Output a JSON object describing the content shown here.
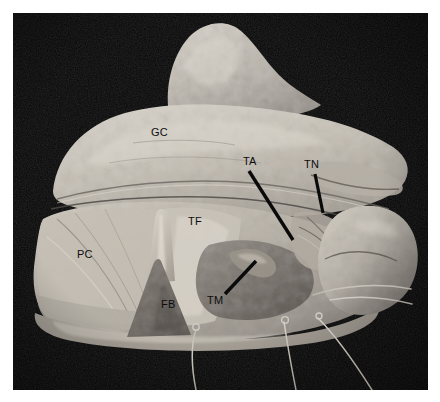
{
  "figure": {
    "kind": "anatomical-dissection-photograph",
    "background_color": "#ffffff",
    "plate_background_color": "#070707",
    "tissue_light_color": "#c9c4ba",
    "tissue_mid_color": "#a09a90",
    "tissue_dark_color": "#6e6861",
    "label_color": "#0d0d0d",
    "leader_color": "#0a0a0a"
  },
  "plate": {
    "x": 13,
    "y": 13,
    "width": 415,
    "height": 377
  },
  "labels": [
    {
      "id": "GC",
      "text": "GC",
      "x": 151,
      "y": 127
    },
    {
      "id": "TA",
      "text": "TA",
      "x": 243,
      "y": 156
    },
    {
      "id": "TN",
      "text": "TN",
      "x": 304,
      "y": 159
    },
    {
      "id": "TF",
      "text": "TF",
      "x": 188,
      "y": 216
    },
    {
      "id": "PC",
      "text": "PC",
      "x": 77,
      "y": 249
    },
    {
      "id": "FB",
      "text": "FB",
      "x": 161,
      "y": 299
    },
    {
      "id": "TM",
      "text": "TM",
      "x": 207,
      "y": 295
    }
  ],
  "leaders": [
    {
      "id": "TA-leader",
      "x1": 249,
      "y1": 171,
      "x2": 293,
      "y2": 240,
      "width": 3.4
    },
    {
      "id": "TN-leader",
      "x1": 315,
      "y1": 174,
      "x2": 323,
      "y2": 213,
      "width": 3.2
    },
    {
      "id": "TM-leader",
      "x1": 225,
      "y1": 294,
      "x2": 256,
      "y2": 261,
      "width": 3.4
    }
  ],
  "wires": [
    {
      "id": "wire-left",
      "path": "M 196 330 C 192 342, 190 360, 196 390"
    },
    {
      "id": "wire-mid",
      "path": "M 284 322 C 286 334, 288 350, 296 390"
    },
    {
      "id": "wire-right",
      "path": "M 318 318 C 330 330, 348 352, 372 390"
    },
    {
      "id": "wire-specimen",
      "path": "M 330 300 C 352 296, 380 296, 412 304"
    }
  ],
  "loops": [
    {
      "id": "loop-left",
      "cx": 196,
      "cy": 327,
      "r": 3.2
    },
    {
      "id": "loop-mid",
      "cx": 285,
      "cy": 320,
      "r": 3.4
    },
    {
      "id": "loop-right",
      "cx": 319,
      "cy": 316,
      "r": 3.0
    }
  ]
}
